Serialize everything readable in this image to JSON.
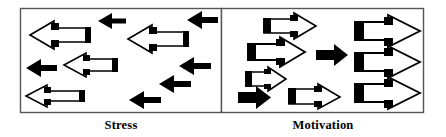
{
  "figure": {
    "title": "",
    "type": "conceptual-arrow-diagram",
    "canvas": {
      "width": 446,
      "height": 137
    },
    "colors": {
      "background": "#ffffff",
      "panel_border": "#555555",
      "arrow_outline": "#000000",
      "arrow_fill": "#ffffff",
      "solid_arrow": "#000000",
      "label_text": "#000000"
    },
    "panels": [
      {
        "id": "stress",
        "label": "Stress",
        "direction": "left",
        "bounds": {
          "x": 20,
          "y": 8,
          "width": 202,
          "height": 105
        },
        "description": "Arrows pointing left, disordered / scattered",
        "hollow_arrows": [
          {
            "x": 28,
            "y": 20,
            "w": 62,
            "h": 30,
            "dir": "left"
          },
          {
            "x": 128,
            "y": 24,
            "w": 60,
            "h": 30,
            "dir": "left"
          },
          {
            "x": 62,
            "y": 52,
            "w": 55,
            "h": 27,
            "dir": "left"
          },
          {
            "x": 24,
            "y": 84,
            "w": 60,
            "h": 24,
            "dir": "left"
          }
        ],
        "solid_arrows": [
          {
            "x": 98,
            "y": 14,
            "w": 28,
            "h": 15,
            "dir": "left"
          },
          {
            "x": 188,
            "y": 12,
            "w": 30,
            "h": 16,
            "dir": "left"
          },
          {
            "x": 26,
            "y": 60,
            "w": 30,
            "h": 16,
            "dir": "left"
          },
          {
            "x": 180,
            "y": 58,
            "w": 32,
            "h": 16,
            "dir": "left"
          },
          {
            "x": 160,
            "y": 76,
            "w": 32,
            "h": 16,
            "dir": "left"
          },
          {
            "x": 130,
            "y": 92,
            "w": 32,
            "h": 16,
            "dir": "left"
          }
        ]
      },
      {
        "id": "motivation",
        "label": "Motivation",
        "direction": "right",
        "bounds": {
          "x": 222,
          "y": 8,
          "width": 202,
          "height": 105
        },
        "description": "Arrows pointing right, aligned / convergent",
        "hollow_arrows": [
          {
            "x": 262,
            "y": 16,
            "w": 60,
            "h": 24,
            "dir": "right"
          },
          {
            "x": 248,
            "y": 40,
            "w": 58,
            "h": 28,
            "dir": "right"
          },
          {
            "x": 246,
            "y": 68,
            "w": 42,
            "h": 22,
            "dir": "right"
          },
          {
            "x": 288,
            "y": 84,
            "w": 56,
            "h": 22,
            "dir": "right"
          },
          {
            "x": 352,
            "y": 14,
            "w": 68,
            "h": 32,
            "dir": "right"
          },
          {
            "x": 352,
            "y": 46,
            "w": 66,
            "h": 30,
            "dir": "right"
          },
          {
            "x": 352,
            "y": 78,
            "w": 68,
            "h": 32,
            "dir": "right"
          }
        ],
        "solid_arrows": [
          {
            "x": 316,
            "y": 46,
            "w": 32,
            "h": 18,
            "dir": "right"
          },
          {
            "x": 238,
            "y": 88,
            "w": 34,
            "h": 18,
            "dir": "right"
          }
        ]
      }
    ]
  },
  "labels": {
    "left": "Stress",
    "right": "Motivation"
  }
}
